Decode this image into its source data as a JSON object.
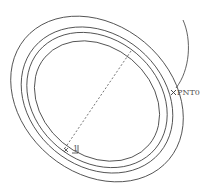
{
  "diagram": {
    "type": "cad-sketch",
    "stroke_color": "#3a3a3a",
    "labels": {
      "point0": "PNT0",
      "point1": "1"
    },
    "ellipses": [
      {
        "cx": 97,
        "cy": 99,
        "rx": 94,
        "ry": 74,
        "rotate": 40
      },
      {
        "cx": 97,
        "cy": 100,
        "rx": 82,
        "ry": 66,
        "rotate": 40
      },
      {
        "cx": 97,
        "cy": 100,
        "rx": 76,
        "ry": 61,
        "rotate": 40
      },
      {
        "cx": 97,
        "cy": 101,
        "rx": 68,
        "ry": 54,
        "rotate": 40
      }
    ]
  }
}
